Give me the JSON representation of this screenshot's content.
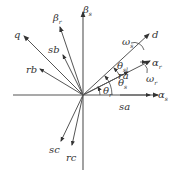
{
  "diagram": {
    "type": "vector-diagram",
    "origin": [
      83,
      95
    ],
    "axes": {
      "alpha_s": {
        "label": "α",
        "sub": "s"
      },
      "beta_s": {
        "label": "β",
        "sub": "s"
      },
      "alpha_r": {
        "label": "α",
        "sub": "r"
      },
      "beta_r": {
        "label": "β",
        "sub": "r"
      },
      "d": {
        "label": "d"
      },
      "q": {
        "label": "q"
      }
    },
    "phase_vectors": {
      "sa": "sa",
      "sb": "sb",
      "sc": "sc",
      "ra": "ra",
      "rb": "rb",
      "rc": "rc"
    },
    "angles": {
      "theta_r": {
        "label": "θ",
        "sub": "r"
      },
      "theta_s": {
        "label": "θ",
        "sub": "s"
      },
      "theta_sl": {
        "label": "θ",
        "sub": "sl"
      }
    },
    "speeds": {
      "omega_s": {
        "label": "ω",
        "sub": "s"
      },
      "omega_r": {
        "label": "ω",
        "sub": "r"
      }
    }
  }
}
